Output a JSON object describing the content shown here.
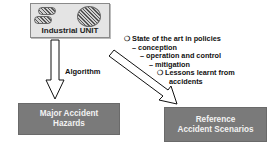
{
  "industrial_unit": {
    "label": "Industrial UNIT",
    "icons": [
      "hatched-oval-icon",
      "hatched-oval-icon",
      "hatched-circle-icon"
    ]
  },
  "arrows": {
    "down_label": "Algorithm"
  },
  "list": {
    "items": [
      {
        "marker": "❍",
        "indent": 0,
        "text": "State of the art in policies"
      },
      {
        "marker": "–",
        "indent": 1,
        "text": "conception"
      },
      {
        "marker": "–",
        "indent": 2,
        "text": "operation and control"
      },
      {
        "marker": "–",
        "indent": 3,
        "text": "mitigation"
      },
      {
        "marker": "❍",
        "indent": 3,
        "text": "Lessons learnt from"
      },
      {
        "marker": "",
        "indent": 4,
        "text": "accidents"
      }
    ]
  },
  "outputs": {
    "hazards": {
      "line1": "Major Accident",
      "line2": "Hazards"
    },
    "scenarios": {
      "line1": "Reference",
      "line2": "Accident Scenarios"
    }
  },
  "colors": {
    "unit_fill": "#e4e4e4",
    "output_fill": "#7a7a7a",
    "output_text": "#f2f2f2"
  }
}
